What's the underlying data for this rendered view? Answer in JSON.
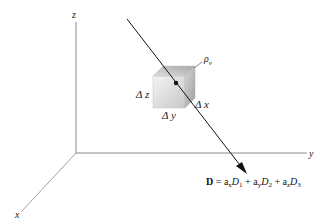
{
  "figure": {
    "axes": {
      "x_label": "x",
      "y_label": "y",
      "z_label": "z"
    },
    "cube": {
      "delta_x_label": "Δ x",
      "delta_y_label": "Δ y",
      "delta_z_label": "Δ z",
      "density_label": "ρ",
      "density_subscript": "v"
    },
    "vector_equation": {
      "lhs": "D",
      "equals": " = ",
      "terms": [
        {
          "unit": "a",
          "unit_sub": "x",
          "comp": "D",
          "comp_sub": "1",
          "op": " + "
        },
        {
          "unit": "a",
          "unit_sub": "y",
          "comp": "D",
          "comp_sub": "2",
          "op": " + "
        },
        {
          "unit": "a",
          "unit_sub": "z",
          "comp": "D",
          "comp_sub": "3",
          "op": ""
        }
      ]
    },
    "colors": {
      "axis": "#8a8a8a",
      "line": "#111111",
      "cube_light": "#f2f2f2",
      "cube_dark": "#bdbdbd"
    }
  }
}
